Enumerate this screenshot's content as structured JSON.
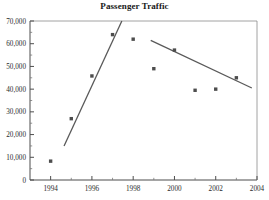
{
  "chart_data": {
    "type": "scatter",
    "title": "Passenger Traffic",
    "xlabel": "",
    "ylabel": "",
    "grid": false,
    "legend": "none",
    "xlim": [
      1993,
      2004
    ],
    "ylim": [
      0,
      70000
    ],
    "x_ticks": [
      1994,
      1996,
      1998,
      2000,
      2002,
      2004
    ],
    "x_tick_labels": [
      "1994",
      "1996",
      "1998",
      "2000",
      "2002",
      "2004"
    ],
    "x_minor_ticks": [
      1995,
      1997,
      1999,
      2001,
      2003
    ],
    "y_ticks": [
      0,
      10000,
      20000,
      30000,
      40000,
      50000,
      60000,
      70000
    ],
    "y_tick_labels": [
      "0",
      "10,000",
      "20,000",
      "30,000",
      "40,000",
      "50,000",
      "60,000",
      "70,000"
    ],
    "y_minor_ticks": [
      5000,
      15000,
      25000,
      35000,
      45000,
      55000,
      65000
    ],
    "marker": "square",
    "marker_color": "#4d4d4d",
    "line_color": "#595959",
    "series": [
      {
        "name": "Passenger Traffic",
        "x": [
          1994,
          1995,
          1996,
          1997,
          1998,
          1999,
          2000,
          2001,
          2002,
          2003
        ],
        "values": [
          8300,
          27000,
          45800,
          64000,
          62000,
          49000,
          57200,
          39500,
          40000,
          45000
        ]
      }
    ],
    "trend_lines": [
      {
        "name": "rising-trend-line",
        "x": [
          1994.65,
          1997.45
        ],
        "y": [
          15000,
          70000
        ]
      },
      {
        "name": "declining-trend-line",
        "x": [
          1998.85,
          2003.75
        ],
        "y": [
          61500,
          40500
        ]
      }
    ]
  }
}
